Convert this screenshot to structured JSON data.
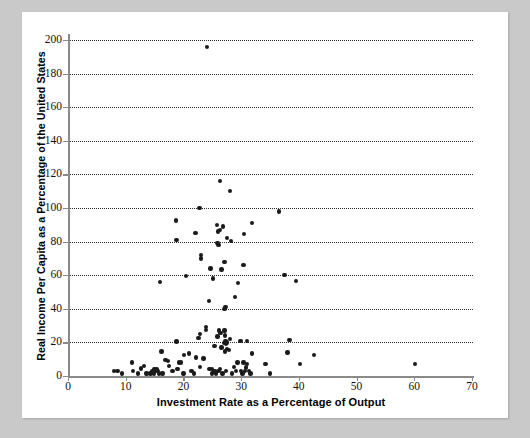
{
  "figure": {
    "background_color": "#c9c9c9",
    "panel_color": "#ffffff",
    "marker_color": "#1a1a1a",
    "grid_color": "#2a2a2a",
    "axis_color": "#8a8a8a"
  },
  "chart_data": {
    "type": "scatter",
    "title": "",
    "xlabel": "Investment Rate as a Percentage of Output",
    "ylabel": "Real Income Per Capita as a Percentage of the United States",
    "xlim": [
      0,
      70
    ],
    "ylim": [
      0,
      200
    ],
    "xticks": [
      0,
      10,
      20,
      30,
      40,
      50,
      60,
      70
    ],
    "yticks": [
      0,
      20,
      40,
      60,
      80,
      100,
      120,
      140,
      160,
      180,
      200
    ],
    "grid": "horizontal-dotted",
    "legend": "none",
    "points": [
      [
        24.1,
        196
      ],
      [
        26.3,
        116
      ],
      [
        28.1,
        110
      ],
      [
        22.8,
        100
      ],
      [
        36.6,
        98
      ],
      [
        18.7,
        92.5
      ],
      [
        31.9,
        91
      ],
      [
        25.8,
        90
      ],
      [
        26.9,
        89
      ],
      [
        26.3,
        87
      ],
      [
        26.0,
        86
      ],
      [
        22.1,
        85
      ],
      [
        30.5,
        84.5
      ],
      [
        18.8,
        81
      ],
      [
        27.6,
        82
      ],
      [
        28.2,
        80.5
      ],
      [
        25.9,
        79
      ],
      [
        26.1,
        78
      ],
      [
        23.0,
        72
      ],
      [
        23.0,
        70
      ],
      [
        27.1,
        68
      ],
      [
        30.4,
        66
      ],
      [
        24.7,
        64
      ],
      [
        26.6,
        63.5
      ],
      [
        20.4,
        59.5
      ],
      [
        37.5,
        60
      ],
      [
        25.1,
        58
      ],
      [
        15.9,
        56
      ],
      [
        29.5,
        55.5
      ],
      [
        39.5,
        56.5
      ],
      [
        28.9,
        47
      ],
      [
        24.4,
        44.5
      ],
      [
        27.3,
        41
      ],
      [
        27.1,
        40
      ],
      [
        23.9,
        29
      ],
      [
        23.9,
        27.5
      ],
      [
        26.2,
        27
      ],
      [
        27.1,
        27
      ],
      [
        26.4,
        25.5
      ],
      [
        22.9,
        25
      ],
      [
        27.2,
        24
      ],
      [
        25.9,
        23.5
      ],
      [
        22.6,
        22.5
      ],
      [
        28.1,
        22
      ],
      [
        18.8,
        20.5
      ],
      [
        27.3,
        21
      ],
      [
        27.5,
        20
      ],
      [
        29.9,
        21
      ],
      [
        31.0,
        21
      ],
      [
        38.4,
        21.5
      ],
      [
        27.0,
        19.5
      ],
      [
        27.4,
        19
      ],
      [
        25.4,
        18
      ],
      [
        26.6,
        17
      ],
      [
        27.6,
        16
      ],
      [
        27.9,
        15.5
      ],
      [
        27.2,
        14.5
      ],
      [
        16.2,
        14.5
      ],
      [
        21.0,
        13.5
      ],
      [
        20.1,
        12.5
      ],
      [
        31.9,
        13.5
      ],
      [
        38.0,
        14
      ],
      [
        42.6,
        12.5
      ],
      [
        22.2,
        11
      ],
      [
        23.5,
        10.5
      ],
      [
        16.9,
        9.5
      ],
      [
        17.3,
        9
      ],
      [
        11.1,
        8
      ],
      [
        19.2,
        8
      ],
      [
        19.6,
        8
      ],
      [
        29.4,
        8
      ],
      [
        30.4,
        8
      ],
      [
        31.0,
        7
      ],
      [
        34.2,
        7
      ],
      [
        40.2,
        7
      ],
      [
        60.1,
        7
      ],
      [
        13.2,
        6
      ],
      [
        17.5,
        6
      ],
      [
        22.9,
        5.5
      ],
      [
        28.8,
        5.5
      ],
      [
        30.8,
        5
      ],
      [
        12.6,
        4.5
      ],
      [
        15.0,
        4
      ],
      [
        15.4,
        4
      ],
      [
        19.0,
        4
      ],
      [
        24.5,
        4
      ],
      [
        25.0,
        4
      ],
      [
        26.3,
        4
      ],
      [
        8.0,
        3
      ],
      [
        8.6,
        3
      ],
      [
        11.3,
        3
      ],
      [
        14.6,
        3
      ],
      [
        15.1,
        3
      ],
      [
        15.5,
        3
      ],
      [
        18.1,
        3
      ],
      [
        21.4,
        3
      ],
      [
        25.4,
        3
      ],
      [
        26.1,
        3
      ],
      [
        27.4,
        3
      ],
      [
        29.1,
        3
      ],
      [
        30.0,
        3
      ],
      [
        30.7,
        3
      ],
      [
        31.4,
        3
      ],
      [
        9.4,
        1.5
      ],
      [
        12.1,
        1.5
      ],
      [
        13.6,
        1.5
      ],
      [
        14.3,
        1.5
      ],
      [
        14.9,
        1.5
      ],
      [
        15.8,
        1.5
      ],
      [
        16.4,
        1.5
      ],
      [
        20.0,
        1.5
      ],
      [
        21.8,
        1.5
      ],
      [
        24.9,
        1.5
      ],
      [
        25.6,
        1.5
      ],
      [
        26.8,
        1.5
      ],
      [
        28.4,
        1.5
      ],
      [
        30.2,
        1.5
      ],
      [
        31.6,
        1.5
      ],
      [
        35.0,
        1.5
      ]
    ]
  }
}
